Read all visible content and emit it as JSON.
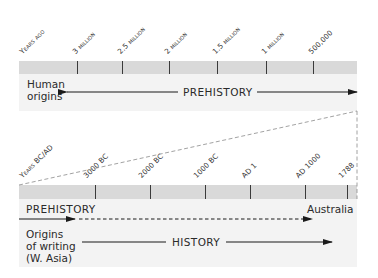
{
  "top_timeline": {
    "axis_label": "Years ago",
    "ticks": [
      {
        "label": "3 million",
        "x": 77
      },
      {
        "label": "2.5 million",
        "x": 122
      },
      {
        "label": "2 million",
        "x": 169
      },
      {
        "label": "1.5 million",
        "x": 217
      },
      {
        "label": "1 million",
        "x": 266
      },
      {
        "label": "500,000",
        "x": 313
      }
    ],
    "start_label_line1": "Human",
    "start_label_line2": "origins",
    "era_label": "PREHISTORY"
  },
  "bottom_timeline": {
    "axis_label": "Years BC/AD",
    "ticks": [
      {
        "label": "3000 BC",
        "x": 95
      },
      {
        "label": "2000 BC",
        "x": 150
      },
      {
        "label": "1000 BC",
        "x": 205
      },
      {
        "label": "AD 1",
        "x": 250
      },
      {
        "label": "AD 1000",
        "x": 305
      },
      {
        "label": "1788",
        "x": 347
      }
    ],
    "prehistory_label": "PREHISTORY",
    "australia_label": "Australia",
    "writing_label_line1": "Origins",
    "writing_label_line2": "of writing",
    "writing_label_line3": "(W. Asia)",
    "history_label": "HISTORY"
  },
  "colors": {
    "bar": "#d9d9d9",
    "panel": "#f3f3f3",
    "line": "#1a1a1a",
    "dashed_connector": "#8a8a8a"
  }
}
